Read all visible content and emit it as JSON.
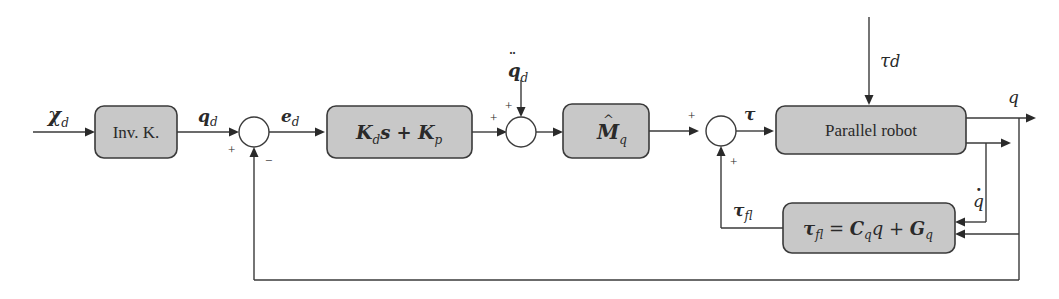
{
  "diagram": {
    "type": "control-block-diagram",
    "blocks": {
      "inv_k": {
        "label": "Inv. K."
      },
      "pd": {
        "label_main1": "K",
        "label_sub1": "d",
        "label_mid": "s + ",
        "label_main2": "K",
        "label_sub2": "p"
      },
      "mass": {
        "label_main": "M",
        "label_hat": "^",
        "label_sub": "q"
      },
      "robot": {
        "label": "Parallel robot"
      },
      "fl": {
        "label_lhs": "τ",
        "label_lhs_sub": "fl",
        "label_eq": " = ",
        "label_c": "C",
        "label_c_sub": "q",
        "label_qdot": "q",
        "label_plus": " + ",
        "label_g": "G",
        "label_g_sub": "q",
        "hat": "^",
        "dot": "·"
      }
    },
    "signals": {
      "xd": {
        "main": "χ",
        "sub": "d"
      },
      "qd": {
        "main": "q",
        "sub": "d"
      },
      "ed": {
        "main": "e",
        "sub": "d"
      },
      "qdd": {
        "main": "q",
        "dots": "¨",
        "sub": "d"
      },
      "tau": {
        "main": "τ"
      },
      "taud": {
        "main": "τ",
        "sub": "d"
      },
      "q": {
        "main": "q"
      },
      "qdot": {
        "main": "q",
        "dot": "·"
      },
      "taufl": {
        "main": "τ",
        "sub": "fl"
      }
    },
    "signs": {
      "sum1_left": "+",
      "sum1_bottom": "−",
      "sum2_left": "+",
      "sum2_top": "+",
      "sum3_left": "+",
      "sum3_bottom": "+"
    }
  }
}
